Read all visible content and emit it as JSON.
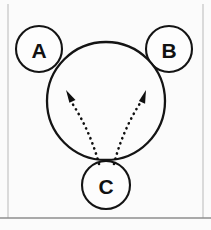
{
  "figure": {
    "background_color": "#fbfbfb",
    "stroke_color": "#141414",
    "arrow_color": "#101010",
    "frame_color": "#b9b9b9",
    "width": 211,
    "height": 230
  },
  "main_body": {
    "name": "central-circle",
    "cx": 106,
    "cy": 101,
    "r": 59
  },
  "nodes": [
    {
      "id": "A",
      "label": "A",
      "cx": 39,
      "cy": 49,
      "r": 23,
      "position": "upper-left"
    },
    {
      "id": "B",
      "label": "B",
      "cx": 169,
      "cy": 49,
      "r": 23,
      "position": "upper-right"
    },
    {
      "id": "C",
      "label": "C",
      "cx": 106,
      "cy": 185,
      "r": 24,
      "position": "bottom"
    }
  ],
  "arrows": [
    {
      "id": "arrow-c-to-a",
      "style": "dotted",
      "from": "C",
      "to": "A",
      "start_x": 99,
      "start_y": 164,
      "end_x": 66,
      "end_y": 90,
      "head": "filled-triangle"
    },
    {
      "id": "arrow-c-to-b",
      "style": "dotted",
      "from": "C",
      "to": "B",
      "start_x": 114,
      "start_y": 164,
      "end_x": 146,
      "end_y": 90,
      "head": "filled-triangle"
    }
  ],
  "frame": {
    "left_x": 8,
    "right_x": 203,
    "top_y": 4,
    "bottom_rule_y": 218
  }
}
